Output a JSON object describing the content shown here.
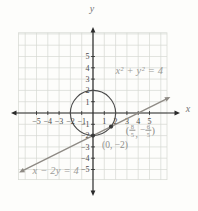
{
  "figure": {
    "width": 198,
    "height": 211,
    "background": "#fdfdfb"
  },
  "colors": {
    "grid": "#d5d8d2",
    "axis": "#2b2b2b",
    "circle": "#4a4a4a",
    "line": "#8f8b85",
    "tick_text": "#4a4a4a",
    "dot": "#3a3a3a"
  },
  "chart_data": {
    "type": "line",
    "axes": {
      "x_label": "x",
      "y_label": "y",
      "x_ticks": [
        -5,
        -4,
        -3,
        -2,
        -1,
        1,
        2,
        3,
        4,
        5
      ],
      "y_ticks": [
        5,
        4,
        3,
        2,
        1,
        -1,
        -2,
        -3,
        -4,
        -5
      ],
      "xlim": [
        -6.6,
        6.55
      ],
      "ylim": [
        -5.9,
        7.1
      ],
      "grid": true
    },
    "curves": [
      {
        "kind": "circle",
        "label": "x² + y² = 4",
        "center": [
          0,
          0
        ],
        "radius": 2,
        "label_anchor": [
          4.1,
          3.7
        ]
      },
      {
        "kind": "line",
        "label": "x − 2y = 4",
        "slope": 0.5,
        "y_intercept": -2,
        "ends": [
          [
            -6.35,
            -5.175
          ],
          [
            6.65,
            1.325
          ]
        ],
        "label_anchor": [
          -3.3,
          -5.15
        ]
      }
    ],
    "points": [
      {
        "x": 0,
        "y": -2,
        "label": "(0, −2)",
        "label_anchor": [
          1.95,
          -2.95
        ]
      },
      {
        "x": 1.6,
        "y": -1.2,
        "label": "(8/5, −6/5)",
        "label_parts": {
          "open": "(",
          "x_num": "8",
          "x_den": "5",
          "comma": ",",
          "minus": "−",
          "y_num": "6",
          "y_den": "5",
          "close": ")"
        },
        "label_anchor": [
          4.2,
          -1.55
        ]
      }
    ]
  }
}
